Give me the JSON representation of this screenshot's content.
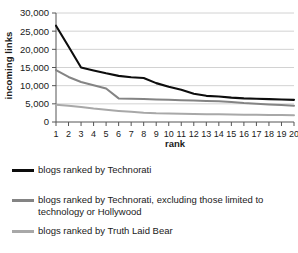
{
  "chart_data": {
    "type": "line",
    "title": "",
    "xlabel": "rank",
    "ylabel": "incoming links",
    "x": [
      1,
      2,
      3,
      4,
      5,
      6,
      7,
      8,
      9,
      10,
      11,
      12,
      13,
      14,
      15,
      16,
      17,
      18,
      19,
      20
    ],
    "xticklabels": [
      "1",
      "2",
      "3",
      "4",
      "5",
      "6",
      "7",
      "8",
      "9",
      "10",
      "11",
      "12",
      "13",
      "14",
      "15",
      "16",
      "17",
      "18",
      "19",
      "20"
    ],
    "yticklabels": [
      "0",
      "5,000",
      "10,000",
      "15,000",
      "20,000",
      "25,000",
      "30,000"
    ],
    "yticks": [
      0,
      5000,
      10000,
      15000,
      20000,
      25000,
      30000
    ],
    "ylim": [
      0,
      30000
    ],
    "xlim": [
      1,
      20
    ],
    "grid": "horizontal",
    "legend_position": "below",
    "series": [
      {
        "name": "blogs ranked by Technorati",
        "color": "#0d0d0d",
        "values": [
          26500,
          20800,
          15000,
          14200,
          13400,
          12700,
          12300,
          12100,
          10700,
          9700,
          8900,
          7800,
          7200,
          7000,
          6700,
          6500,
          6400,
          6300,
          6200,
          6100
        ]
      },
      {
        "name": "blogs ranked by Technorati, excluding those limited to technology or Hollywood",
        "color": "#848484",
        "values": [
          14300,
          12400,
          11000,
          10100,
          9200,
          6500,
          6400,
          6300,
          6200,
          6100,
          6000,
          5900,
          5800,
          5700,
          5500,
          5200,
          5000,
          4800,
          4650,
          4500
        ]
      },
      {
        "name": "blogs ranked by Truth Laid Bear",
        "color": "#a8a8a8",
        "values": [
          4750,
          4450,
          4150,
          3700,
          3350,
          3050,
          2800,
          2550,
          2400,
          2350,
          2300,
          2200,
          2150,
          2100,
          2050,
          2000,
          1980,
          1950,
          1900,
          1850
        ]
      }
    ]
  },
  "legend": {
    "items": [
      {
        "label": "blogs ranked by Technorati",
        "color": "#0d0d0d"
      },
      {
        "label": "blogs ranked by Technorati, excluding those limited to technology or Hollywood",
        "color": "#848484"
      },
      {
        "label": "blogs ranked by Truth Laid Bear",
        "color": "#a8a8a8"
      }
    ]
  }
}
